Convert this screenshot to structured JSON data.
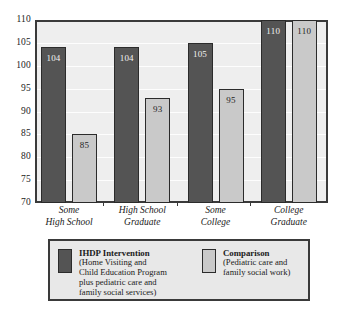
{
  "chart_data": {
    "type": "bar",
    "title": "",
    "subtitle": "",
    "xlabel": "",
    "ylabel": "",
    "ylim": [
      70,
      110
    ],
    "yticks": [
      110,
      105,
      100,
      95,
      90,
      85,
      80,
      75,
      70
    ],
    "grid": true,
    "legend_position": "bottom",
    "categories": [
      "Some High School",
      "High School Graduate",
      "Some College",
      "College Graduate"
    ],
    "category_lines": [
      [
        "Some",
        "High School"
      ],
      [
        "High School",
        "Graduate"
      ],
      [
        "Some",
        "College"
      ],
      [
        "College",
        "Graduate"
      ]
    ],
    "series": [
      {
        "name": "IHDP Intervention",
        "color": "#545454",
        "values": [
          104,
          104,
          105,
          110
        ]
      },
      {
        "name": "Comparison",
        "color": "#c9c9c9",
        "values": [
          85,
          93,
          95,
          110
        ]
      }
    ]
  },
  "legend": {
    "entries": [
      {
        "swatch": "series-a",
        "title": "IHDP Intervention",
        "desc_lines": [
          "(Home Visiting and",
          "Child Education Program",
          "plus pediatric care and",
          "family social services)"
        ]
      },
      {
        "swatch": "series-b",
        "title": "Comparison",
        "desc_lines": [
          "(Pediatric care and",
          "family social work)"
        ]
      }
    ]
  },
  "colors": {
    "series_a": "#545454",
    "series_b": "#c9c9c9",
    "plot_background": "#eeeeee",
    "frame": "#3a3a3a",
    "gridline": "#fdfdfd",
    "legend_background": "#e8e8e8"
  }
}
